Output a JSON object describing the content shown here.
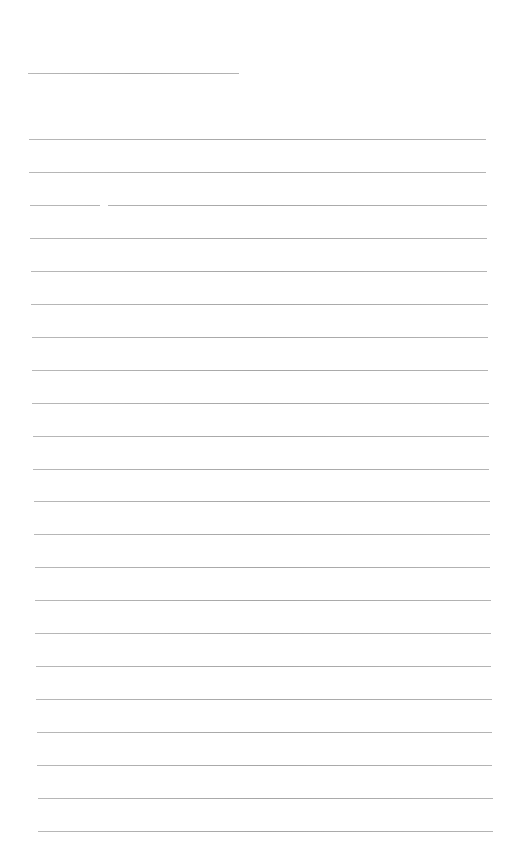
{
  "page": {
    "type": "blank lined paper",
    "background": "#ffffff",
    "line_color": "#aaaaaa",
    "header_line": {
      "top": 73,
      "left": 28,
      "width": 211
    },
    "ruled_lines": {
      "count": 22,
      "first_top": 139,
      "spacing": 32.95,
      "left_start": 29,
      "left_end": 38,
      "right_start": 486,
      "right_end": 493
    },
    "text": ""
  }
}
